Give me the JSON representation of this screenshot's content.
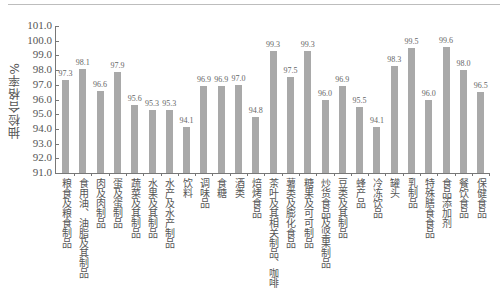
{
  "chart_data": {
    "type": "bar",
    "title": "",
    "xlabel": "",
    "ylabel": "抽检合格率%",
    "ylim": [
      91.0,
      101.0
    ],
    "yticks": [
      "91.0",
      "92.0",
      "93.0",
      "94.0",
      "95.0",
      "96.0",
      "97.0",
      "98.0",
      "99.0",
      "100.0",
      "101.0"
    ],
    "categories": [
      "粮食及粮食制品",
      "食用油、油脂及其制品",
      "肉及肉制品",
      "蛋及蛋制品",
      "蔬菜及其制品",
      "水果及其制品",
      "水产及水产制品",
      "饮料",
      "调味品",
      "食糖",
      "酒类",
      "焙烤食品",
      "茶叶及其相关制品、咖啡",
      "薯类及膨化食品",
      "糖果及可可制品",
      "炒货食品及坚果制品",
      "豆类及其制品",
      "蜂产品",
      "冷冻饮品",
      "罐头",
      "乳制品",
      "特殊膳食食品",
      "食品添加剂",
      "餐饮食品",
      "保健食品"
    ],
    "values": [
      97.3,
      98.1,
      96.6,
      97.9,
      95.6,
      95.3,
      95.3,
      94.1,
      96.9,
      96.9,
      97.0,
      94.8,
      99.3,
      97.5,
      99.3,
      96.0,
      96.9,
      95.5,
      94.1,
      98.3,
      99.5,
      96.0,
      99.6,
      98.0,
      96.5
    ],
    "value_labels": [
      "97.3",
      "98.1",
      "96.6",
      "97.9",
      "95.6",
      "95.3",
      "95.3",
      "94.1",
      "96.9",
      "96.9",
      "97.0",
      "94.8",
      "99.3",
      "97.5",
      "99.3",
      "96.0",
      "96.9",
      "95.5",
      "94.1",
      "98.3",
      "99.5",
      "96.0",
      "99.6",
      "98.0",
      "96.5"
    ],
    "grid": false,
    "bar_color": "#a9a9a9"
  }
}
